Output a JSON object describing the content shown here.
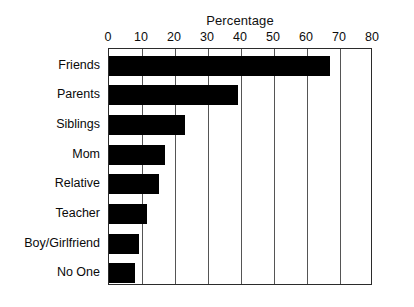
{
  "chart_data": {
    "type": "bar",
    "orientation": "horizontal",
    "title": "Percentage",
    "xlabel": "",
    "ylabel": "",
    "xlim": [
      0,
      80
    ],
    "xticks": [
      0,
      10,
      20,
      30,
      40,
      50,
      60,
      70,
      80
    ],
    "grid": true,
    "legend": false,
    "bar_color": "#000000",
    "frame_color": "#2b2b2b",
    "categories": [
      "Friends",
      "Parents",
      "Siblings",
      "Mom",
      "Relative",
      "Teacher",
      "Boy/Girlfriend",
      "No One"
    ],
    "values": [
      67,
      39,
      23,
      17,
      15,
      11.5,
      9,
      8
    ],
    "series": [
      {
        "name": "Percentage",
        "values": [
          67,
          39,
          23,
          17,
          15,
          11.5,
          9,
          8
        ]
      }
    ]
  }
}
